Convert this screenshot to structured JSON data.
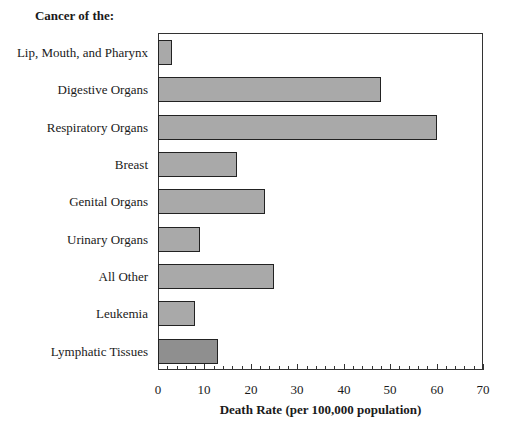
{
  "chart_data": {
    "type": "bar",
    "orientation": "horizontal",
    "title": "",
    "y_heading": "Cancer of the:",
    "xlabel": "Death Rate (per 100,000 population)",
    "ylabel": "",
    "xlim": [
      0,
      70
    ],
    "x_ticks": [
      0,
      10,
      20,
      30,
      40,
      50,
      60,
      70
    ],
    "minor_tick_step": 2,
    "grid": false,
    "legend": null,
    "categories": [
      "Lip, Mouth, and Pharynx",
      "Digestive Organs",
      "Respiratory Organs",
      "Breast",
      "Genital Organs",
      "Urinary Organs",
      "All Other",
      "Leukemia",
      "Lymphatic Tissues"
    ],
    "values": [
      3,
      48,
      60,
      17,
      23,
      9,
      25,
      8,
      13
    ],
    "bar_colors": [
      "#a9a9a9",
      "#a9a9a9",
      "#a9a9a9",
      "#a9a9a9",
      "#a9a9a9",
      "#a9a9a9",
      "#a9a9a9",
      "#a9a9a9",
      "#8f8f8f"
    ]
  },
  "labels": {
    "y_heading": "Cancer of the:",
    "x_title": "Death Rate (per 100,000 population)",
    "cats": [
      "Lip, Mouth, and Pharynx",
      "Digestive Organs",
      "Respiratory Organs",
      "Breast",
      "Genital Organs",
      "Urinary Organs",
      "All Other",
      "Leukemia",
      "Lymphatic Tissues"
    ],
    "ticks": [
      "0",
      "10",
      "20",
      "30",
      "40",
      "50",
      "60",
      "70"
    ]
  }
}
